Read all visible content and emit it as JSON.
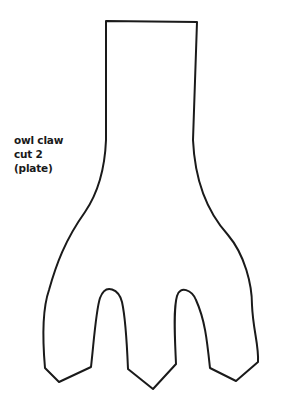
{
  "template": {
    "label_lines": [
      "owl claw",
      "cut 2",
      "(plate)"
    ],
    "shape": "owl-claw-outline",
    "stroke_color": "#1a1a1a",
    "background": "#ffffff"
  }
}
